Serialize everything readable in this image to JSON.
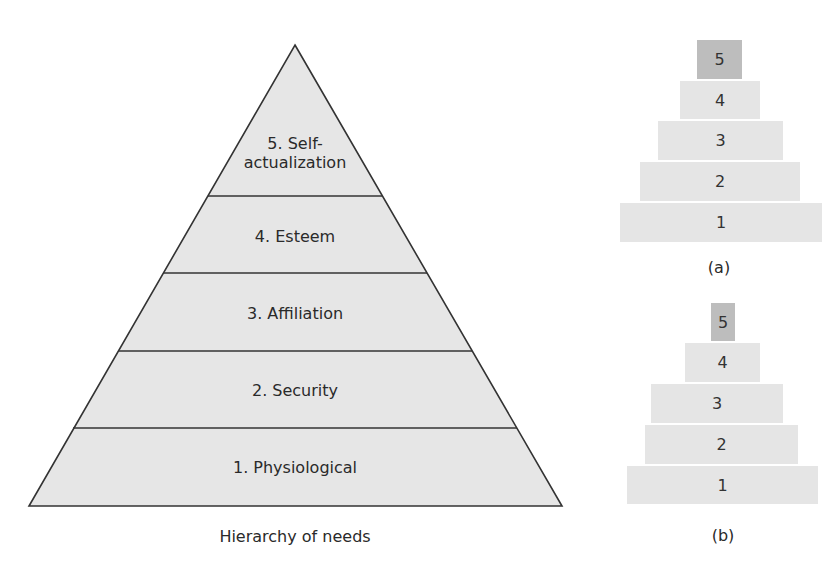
{
  "main_pyramid": {
    "caption": "Hierarchy of needs",
    "fill_color": "#e6e6e6",
    "line_color": "#333333",
    "levels": [
      {
        "number": 5,
        "label_line1": "5. Self-",
        "label_line2": "actualization"
      },
      {
        "number": 4,
        "label": "4. Esteem"
      },
      {
        "number": 3,
        "label": "3. Affiliation"
      },
      {
        "number": 2,
        "label": "2. Security"
      },
      {
        "number": 1,
        "label": "1. Physiological"
      }
    ]
  },
  "pyramid_a": {
    "caption": "(a)",
    "blocks": [
      {
        "label": "5",
        "color": "#bdbdbd"
      },
      {
        "label": "4",
        "color": "#e5e5e5"
      },
      {
        "label": "3",
        "color": "#e5e5e5"
      },
      {
        "label": "2",
        "color": "#e5e5e5"
      },
      {
        "label": "1",
        "color": "#e5e5e5"
      }
    ]
  },
  "pyramid_b": {
    "caption": "(b)",
    "blocks": [
      {
        "label": "5",
        "color": "#bdbdbd"
      },
      {
        "label": "4",
        "color": "#e5e5e5"
      },
      {
        "label": "3",
        "color": "#e5e5e5"
      },
      {
        "label": "2",
        "color": "#e5e5e5"
      },
      {
        "label": "1",
        "color": "#e5e5e5"
      }
    ]
  }
}
